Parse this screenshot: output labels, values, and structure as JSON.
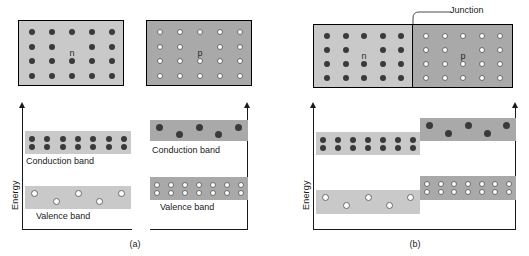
{
  "figure": {
    "colors": {
      "block_n_fill": "#c9c9c9",
      "block_p_fill": "#a9a9a9",
      "band_n_fill": "#c9c9c9",
      "band_p_fill": "#a9a9a9",
      "dot_electron": "#3a3a3a",
      "dot_hole": "#ffffff",
      "outline": "#000000",
      "axis": "#1a1a1a"
    }
  },
  "panel_a": {
    "caption": "(a)",
    "axis_label": "Energy",
    "blocks": [
      {
        "label": "n",
        "type": "n-type",
        "carrier": "electron",
        "rows": 4,
        "cols": 5
      },
      {
        "label": "p",
        "type": "p-type",
        "carrier": "hole",
        "rows": 4,
        "cols": 5
      }
    ],
    "bands": [
      {
        "side": "n",
        "name": "Conduction band",
        "fill": "full",
        "carrier": "electron",
        "rows": 2,
        "cols": 7
      },
      {
        "side": "n",
        "name": "Valence band",
        "fill": "sparse",
        "carrier": "hole",
        "count": 5
      },
      {
        "side": "p",
        "name": "Conduction band",
        "fill": "sparse",
        "carrier": "electron",
        "count": 5
      },
      {
        "side": "p",
        "name": "Valence band",
        "fill": "full",
        "carrier": "hole",
        "rows": 2,
        "cols": 7
      }
    ]
  },
  "panel_b": {
    "caption": "(b)",
    "axis_label": "Energy",
    "junction_label": "Junction",
    "block": {
      "n_label": "n",
      "p_label": "p",
      "n_rows": 4,
      "n_cols": 5,
      "p_rows": 4,
      "p_cols": 5
    },
    "bands": [
      {
        "side": "n",
        "name": "conduction",
        "fill": "full",
        "carrier": "electron",
        "rows": 2,
        "cols": 7,
        "level": "low"
      },
      {
        "side": "p",
        "name": "conduction",
        "fill": "sparse",
        "carrier": "electron",
        "count": 5,
        "level": "high"
      },
      {
        "side": "n",
        "name": "valence",
        "fill": "sparse",
        "carrier": "hole",
        "count": 5,
        "level": "low"
      },
      {
        "side": "p",
        "name": "valence",
        "fill": "full",
        "carrier": "hole",
        "rows": 2,
        "cols": 7,
        "level": "high"
      }
    ]
  }
}
